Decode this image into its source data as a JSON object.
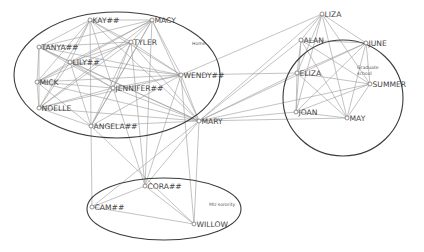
{
  "diagram": {
    "type": "social-network",
    "clusters": [
      {
        "id": "home",
        "label": "Home",
        "cx": 117,
        "cy": 75,
        "rx": 103,
        "ry": 63,
        "label_x": 192,
        "label_y": 45
      },
      {
        "id": "grad",
        "label_lines": [
          "Graduate",
          "school"
        ],
        "cx": 343,
        "cy": 98,
        "rx": 60,
        "ry": 58,
        "label_x": 357,
        "label_y": 69
      },
      {
        "id": "sorority",
        "label": "MU sorority",
        "cx": 164,
        "cy": 209,
        "rx": 77,
        "ry": 31,
        "label_x": 209,
        "label_y": 206
      }
    ],
    "nodes": [
      {
        "id": "KAY",
        "label": "KAY##",
        "x": 90,
        "y": 20
      },
      {
        "id": "MACY",
        "label": "MACY",
        "x": 152,
        "y": 20
      },
      {
        "id": "TANYA",
        "label": "TANYA##",
        "x": 39,
        "y": 47
      },
      {
        "id": "TYLER",
        "label": "TYLER",
        "x": 131,
        "y": 42
      },
      {
        "id": "LILY",
        "label": "LILY##",
        "x": 70,
        "y": 62
      },
      {
        "id": "WENDY",
        "label": "WENDY##",
        "x": 181,
        "y": 75
      },
      {
        "id": "MICK",
        "label": "MICK",
        "x": 37,
        "y": 82
      },
      {
        "id": "JENNIFER",
        "label": "JENNIFER##",
        "x": 113,
        "y": 88
      },
      {
        "id": "NOELLE",
        "label": "NOELLE",
        "x": 39,
        "y": 108
      },
      {
        "id": "ANGELA",
        "label": "ANGELA##",
        "x": 91,
        "y": 126
      },
      {
        "id": "MARY",
        "label": "MARY",
        "x": 199,
        "y": 121
      },
      {
        "id": "LIZA",
        "label": "LIZA",
        "x": 322,
        "y": 14
      },
      {
        "id": "ALAN",
        "label": "ALAN",
        "x": 301,
        "y": 40
      },
      {
        "id": "JUNE",
        "label": "JUNE",
        "x": 366,
        "y": 43
      },
      {
        "id": "ELIZA",
        "label": "ELIZA",
        "x": 297,
        "y": 73
      },
      {
        "id": "SUMMER",
        "label": "SUMMER",
        "x": 370,
        "y": 84
      },
      {
        "id": "JOAN",
        "label": "JOAN",
        "x": 296,
        "y": 112
      },
      {
        "id": "MAY",
        "label": "MAY",
        "x": 347,
        "y": 118
      },
      {
        "id": "CORA",
        "label": "CORA##",
        "x": 145,
        "y": 186
      },
      {
        "id": "CAM",
        "label": "CAM##",
        "x": 92,
        "y": 207
      },
      {
        "id": "WILLOW",
        "label": "WILLOW",
        "x": 194,
        "y": 224
      }
    ],
    "edges": [
      [
        "KAY",
        "MACY"
      ],
      [
        "KAY",
        "TANYA"
      ],
      [
        "KAY",
        "TYLER"
      ],
      [
        "KAY",
        "LILY"
      ],
      [
        "KAY",
        "WENDY"
      ],
      [
        "KAY",
        "MICK"
      ],
      [
        "KAY",
        "JENNIFER"
      ],
      [
        "KAY",
        "NOELLE"
      ],
      [
        "KAY",
        "ANGELA"
      ],
      [
        "KAY",
        "MARY"
      ],
      [
        "MACY",
        "TANYA"
      ],
      [
        "MACY",
        "TYLER"
      ],
      [
        "MACY",
        "LILY"
      ],
      [
        "MACY",
        "WENDY"
      ],
      [
        "MACY",
        "MICK"
      ],
      [
        "MACY",
        "JENNIFER"
      ],
      [
        "MACY",
        "NOELLE"
      ],
      [
        "MACY",
        "ANGELA"
      ],
      [
        "MACY",
        "MARY"
      ],
      [
        "TANYA",
        "TYLER"
      ],
      [
        "TANYA",
        "LILY"
      ],
      [
        "TANYA",
        "WENDY"
      ],
      [
        "TANYA",
        "MICK"
      ],
      [
        "TANYA",
        "JENNIFER"
      ],
      [
        "TANYA",
        "NOELLE"
      ],
      [
        "TANYA",
        "MARY"
      ],
      [
        "TYLER",
        "LILY"
      ],
      [
        "TYLER",
        "WENDY"
      ],
      [
        "TYLER",
        "MICK"
      ],
      [
        "TYLER",
        "JENNIFER"
      ],
      [
        "TYLER",
        "NOELLE"
      ],
      [
        "TYLER",
        "ANGELA"
      ],
      [
        "TYLER",
        "MARY"
      ],
      [
        "LILY",
        "WENDY"
      ],
      [
        "LILY",
        "MICK"
      ],
      [
        "LILY",
        "JENNIFER"
      ],
      [
        "LILY",
        "NOELLE"
      ],
      [
        "LILY",
        "ANGELA"
      ],
      [
        "LILY",
        "MARY"
      ],
      [
        "WENDY",
        "MICK"
      ],
      [
        "WENDY",
        "JENNIFER"
      ],
      [
        "WENDY",
        "NOELLE"
      ],
      [
        "WENDY",
        "ANGELA"
      ],
      [
        "WENDY",
        "MARY"
      ],
      [
        "WENDY",
        "LIZA"
      ],
      [
        "WENDY",
        "ELIZA"
      ],
      [
        "MICK",
        "JENNIFER"
      ],
      [
        "MICK",
        "NOELLE"
      ],
      [
        "MICK",
        "ANGELA"
      ],
      [
        "MICK",
        "MARY"
      ],
      [
        "JENNIFER",
        "NOELLE"
      ],
      [
        "JENNIFER",
        "ANGELA"
      ],
      [
        "JENNIFER",
        "MARY"
      ],
      [
        "NOELLE",
        "ANGELA"
      ],
      [
        "NOELLE",
        "MARY"
      ],
      [
        "ANGELA",
        "MARY"
      ],
      [
        "ANGELA",
        "CAM"
      ],
      [
        "ANGELA",
        "WILLOW"
      ],
      [
        "MARY",
        "LIZA"
      ],
      [
        "MARY",
        "ALAN"
      ],
      [
        "MARY",
        "JUNE"
      ],
      [
        "MARY",
        "ELIZA"
      ],
      [
        "MARY",
        "SUMMER"
      ],
      [
        "MARY",
        "JOAN"
      ],
      [
        "MARY",
        "MAY"
      ],
      [
        "MARY",
        "CORA"
      ],
      [
        "MARY",
        "CAM"
      ],
      [
        "MARY",
        "WILLOW"
      ],
      [
        "JENNIFER",
        "CORA"
      ],
      [
        "TYLER",
        "CORA"
      ],
      [
        "WENDY",
        "CORA"
      ],
      [
        "WENDY",
        "WILLOW"
      ],
      [
        "MACY",
        "CORA"
      ],
      [
        "LIZA",
        "ALAN"
      ],
      [
        "LIZA",
        "JUNE"
      ],
      [
        "LIZA",
        "ELIZA"
      ],
      [
        "LIZA",
        "SUMMER"
      ],
      [
        "LIZA",
        "JOAN"
      ],
      [
        "LIZA",
        "MAY"
      ],
      [
        "ALAN",
        "JUNE"
      ],
      [
        "ALAN",
        "ELIZA"
      ],
      [
        "ALAN",
        "SUMMER"
      ],
      [
        "ALAN",
        "JOAN"
      ],
      [
        "ALAN",
        "MAY"
      ],
      [
        "JUNE",
        "ELIZA"
      ],
      [
        "JUNE",
        "SUMMER"
      ],
      [
        "JUNE",
        "JOAN"
      ],
      [
        "JUNE",
        "MAY"
      ],
      [
        "ELIZA",
        "SUMMER"
      ],
      [
        "ELIZA",
        "JOAN"
      ],
      [
        "ELIZA",
        "MAY"
      ],
      [
        "SUMMER",
        "JOAN"
      ],
      [
        "SUMMER",
        "MAY"
      ],
      [
        "JOAN",
        "MAY"
      ],
      [
        "CORA",
        "CAM"
      ],
      [
        "CORA",
        "WILLOW"
      ],
      [
        "CAM",
        "WILLOW"
      ]
    ]
  }
}
